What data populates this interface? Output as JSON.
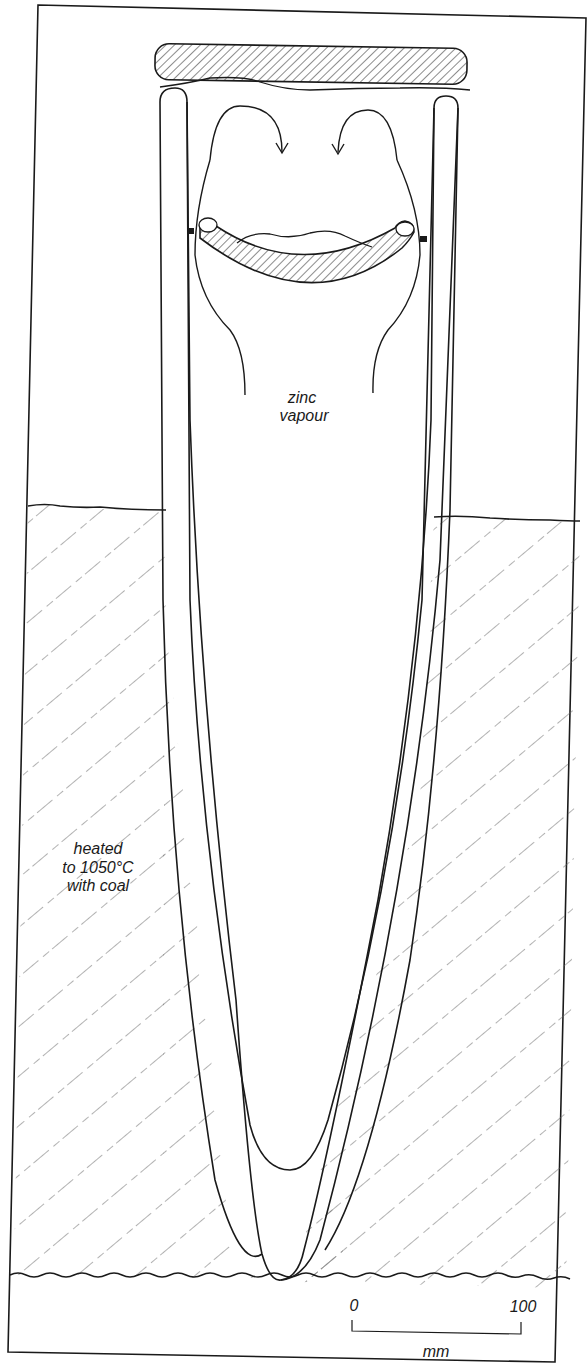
{
  "diagram": {
    "type": "cross-section",
    "labels": {
      "vapour_line1": "zinc",
      "vapour_line2": "vapour",
      "heat_line1": "heated",
      "heat_line2": "to 1050°C",
      "heat_line3": "with coal"
    },
    "scale_bar": {
      "start_label": "0",
      "end_label": "100",
      "unit": "mm"
    },
    "colors": {
      "ink": "#1a1a1a",
      "paper": "#ffffff",
      "hatch": "#555555"
    }
  }
}
